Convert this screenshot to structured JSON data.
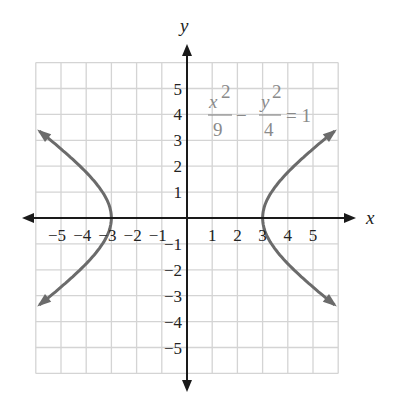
{
  "chart_data": {
    "type": "line",
    "title": "",
    "equation": {
      "num1": "x",
      "exp1": "2",
      "den1": "9",
      "minus": "−",
      "num2": "y",
      "exp2": "2",
      "den2": "4",
      "rhs": "= 1"
    },
    "xlabel": "x",
    "ylabel": "y",
    "xlim": [
      -6,
      6
    ],
    "ylim": [
      -6,
      6
    ],
    "grid": true,
    "x_ticks": [
      "−5",
      "−4",
      "−3",
      "−2",
      "−1",
      "1",
      "2",
      "3",
      "4",
      "5"
    ],
    "x_tick_values": [
      -5,
      -4,
      -3,
      -2,
      -1,
      1,
      2,
      3,
      4,
      5
    ],
    "y_ticks": [
      "5",
      "4",
      "3",
      "2",
      "1",
      "−1",
      "−2",
      "−3",
      "−4",
      "−5"
    ],
    "y_tick_values": [
      5,
      4,
      3,
      2,
      1,
      -1,
      -2,
      -3,
      -4,
      -5
    ],
    "series": [
      {
        "name": "right branch",
        "description": "x = 3·sqrt(1 + y²/4), x>0",
        "x": [
          5.85,
          5,
          4,
          3.5,
          3.2,
          3,
          3.2,
          3.5,
          4,
          5,
          5.85
        ],
        "y": [
          3.35,
          2.67,
          1.76,
          1.2,
          0.74,
          0,
          -0.74,
          -1.2,
          -1.76,
          -2.67,
          -3.35
        ]
      },
      {
        "name": "left branch",
        "description": "x = -3·sqrt(1 + y²/4), x<0",
        "x": [
          -5.85,
          -5,
          -4,
          -3.5,
          -3.2,
          -3,
          -3.2,
          -3.5,
          -4,
          -5,
          -5.85
        ],
        "y": [
          3.35,
          2.67,
          1.76,
          1.2,
          0.74,
          0,
          -0.74,
          -1.2,
          -1.76,
          -2.67,
          -3.35
        ]
      }
    ],
    "colors": {
      "curve": "#6b6b6b",
      "axes": "#1a1a1a",
      "grid": "#d4d4d4",
      "equation": "#8a8a8a"
    }
  }
}
